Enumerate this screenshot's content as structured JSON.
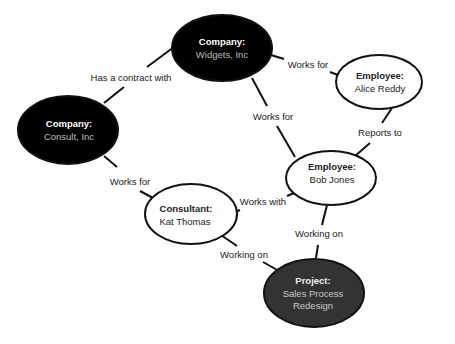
{
  "diagram": {
    "type": "entity-relationship graph",
    "colors": {
      "dark_fill": "#000000",
      "project_fill": "#333333",
      "light_fill": "#ffffff",
      "stroke": "#111111",
      "dark_title_text": "#ffffff",
      "dark_value_text": "#bdbdbd",
      "light_text": "#222222"
    },
    "nodes": [
      {
        "id": "widgets",
        "title": "Company:",
        "value": "Widgets, Inc",
        "style": "dark"
      },
      {
        "id": "consult",
        "title": "Company:",
        "value": "Consult, Inc",
        "style": "dark"
      },
      {
        "id": "alice",
        "title": "Employee:",
        "value": "Alice Reddy",
        "style": "light"
      },
      {
        "id": "bob",
        "title": "Employee:",
        "value": "Bob Jones",
        "style": "light"
      },
      {
        "id": "kat",
        "title": "Consultant:",
        "value": "Kat Thomas",
        "style": "light"
      },
      {
        "id": "project",
        "title": "Project:",
        "value_line1": "Sales Process",
        "value_line2": "Redesign",
        "style": "project"
      }
    ],
    "edges": [
      {
        "from": "consult",
        "to": "widgets",
        "label": "Has a contract with"
      },
      {
        "from": "alice",
        "to": "widgets",
        "label": "Works for"
      },
      {
        "from": "bob",
        "to": "widgets",
        "label": "Works for"
      },
      {
        "from": "bob",
        "to": "alice",
        "label": "Reports to"
      },
      {
        "from": "kat",
        "to": "consult",
        "label": "Works for"
      },
      {
        "from": "kat",
        "to": "bob",
        "label": "Works with"
      },
      {
        "from": "bob",
        "to": "project",
        "label": "Working on"
      },
      {
        "from": "kat",
        "to": "project",
        "label": "Working on"
      }
    ]
  }
}
